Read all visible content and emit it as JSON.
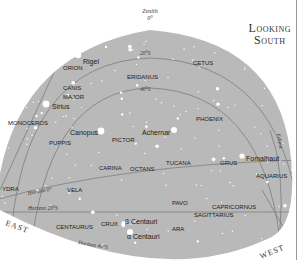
{
  "title": {
    "line1": "Looking",
    "line2": "South"
  },
  "colors": {
    "sky": "#b9b9b9",
    "grid": "#7d7d7d",
    "background": "#ffffff",
    "star": "#ffffff",
    "text": "#1a1a1a"
  },
  "zenith": {
    "label": "Zenith",
    "value": "0°"
  },
  "grid_labels": {
    "dec20": "20°S",
    "dec40": "40°S",
    "horizon0": "Horizon 0°",
    "horizon20": "Horizon 20°S",
    "horizon40": "Horizon 40°S",
    "ecliptic": "Ecliptic"
  },
  "directions": {
    "east": "EAST",
    "west": "WEST"
  },
  "constellations": [
    {
      "name": "ORION",
      "x": 63,
      "y": 70
    },
    {
      "name": "CETUS",
      "x": 193,
      "y": 65
    },
    {
      "name": "ERIDANUS",
      "x": 127,
      "y": 79
    },
    {
      "name": "CANIS",
      "x": 63,
      "y": 90
    },
    {
      "name": "MAJOR",
      "x": 63,
      "y": 99
    },
    {
      "name": "MONOCEROS",
      "x": 8,
      "y": 125
    },
    {
      "name": "PHOENIX",
      "x": 196,
      "y": 121
    },
    {
      "name": "PUPPIS",
      "x": 49,
      "y": 145
    },
    {
      "name": "PICTOR",
      "x": 112,
      "y": 142
    },
    {
      "name": "CARINA",
      "x": 99,
      "y": 170
    },
    {
      "name": "OCTANS",
      "x": 130,
      "y": 171
    },
    {
      "name": "TUCANA",
      "x": 166,
      "y": 165
    },
    {
      "name": "GRUS",
      "x": 220,
      "y": 165
    },
    {
      "name": "AQUARIUS",
      "x": 256,
      "y": 178
    },
    {
      "name": "YDRA",
      "x": 2,
      "y": 191
    },
    {
      "name": "VELA",
      "x": 67,
      "y": 192
    },
    {
      "name": "PAVO",
      "x": 172,
      "y": 205
    },
    {
      "name": "CAPRICORNUS",
      "x": 212,
      "y": 209
    },
    {
      "name": "SAGITTARIUS",
      "x": 194,
      "y": 217
    },
    {
      "name": "CENTAURUS",
      "x": 56,
      "y": 229
    },
    {
      "name": "CRUX",
      "x": 101,
      "y": 226
    },
    {
      "name": "ARA",
      "x": 172,
      "y": 231
    }
  ],
  "stars": [
    {
      "name": "Rigel",
      "x": 78,
      "y": 55,
      "label_x": 83,
      "label_y": 62,
      "r": 3.2
    },
    {
      "name": "Sirius",
      "x": 46,
      "y": 104,
      "label_x": 52,
      "label_y": 107,
      "r": 3.4
    },
    {
      "name": "Canopus",
      "x": 101,
      "y": 131,
      "label_x": 70,
      "label_y": 133,
      "r": 3.4
    },
    {
      "name": "Achernar",
      "x": 174,
      "y": 130,
      "label_x": 142,
      "label_y": 133,
      "r": 3.0
    },
    {
      "name": "Fomalhaut",
      "x": 242,
      "y": 156,
      "label_x": 246,
      "label_y": 159,
      "r": 2.6
    },
    {
      "name": "β Centauri",
      "x": 124,
      "y": 224,
      "label_x": 125,
      "label_y": 222,
      "r": 2.8
    },
    {
      "name": "α Centauri",
      "x": 130,
      "y": 232,
      "label_x": 127,
      "label_y": 237,
      "r": 3.0
    }
  ]
}
